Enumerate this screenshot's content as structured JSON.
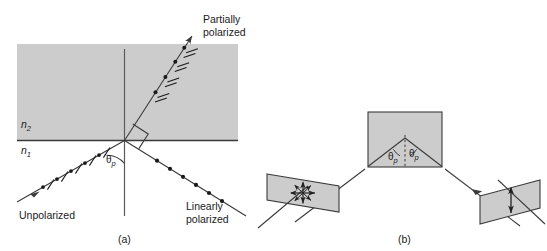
{
  "figure": {
    "title_caption_a": "(a)",
    "title_caption_b": "(b)",
    "colors": {
      "medium_fill": "#cccccc",
      "stroke": "#3a3a3a",
      "text": "#1a1a1a",
      "background": "#ffffff"
    }
  },
  "panel_a": {
    "caption": "(a)",
    "medium_upper_label": "n",
    "medium_upper_sub": "2",
    "medium_lower_label": "n",
    "medium_lower_sub": "1",
    "incident_ray_label": "Unpolarized",
    "reflected_ray_label_line1": "Partially",
    "reflected_ray_label_line2": "polarized",
    "refracted_ray_label_line1": "Linearly",
    "refracted_ray_label_line2": "polarized",
    "angle_label": "θ",
    "angle_sub": "p",
    "right_angle_marker": "90°",
    "markers": {
      "incident": "dots-and-ticks",
      "reflected": "dots-and-double-ticks",
      "refracted": "dots-only"
    }
  },
  "panel_b": {
    "caption": "(b)",
    "angle_label_left": "θ",
    "angle_sub_left": "p",
    "angle_label_right": "θ",
    "angle_sub_right": "p",
    "left_plane_polarization": "four-way-arrow",
    "right_plane_polarization": "vertical-double-arrow"
  }
}
